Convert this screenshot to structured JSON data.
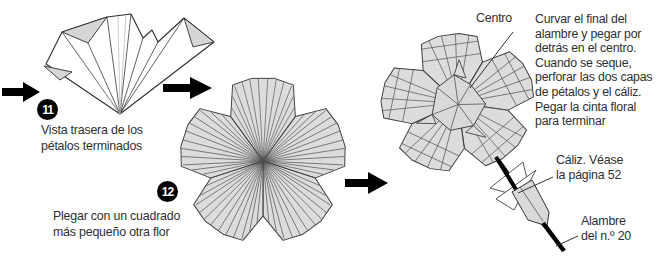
{
  "figure": {
    "steps": [
      {
        "number": "11",
        "caption": "Vista trasera de los\npétalos terminados"
      },
      {
        "number": "12",
        "caption": "Plegar con un cuadrado\nmás pequeño otra flor"
      }
    ],
    "labels": {
      "centro": "Centro",
      "caliz": "Cáliz. Véase\nla página 52",
      "alambre": "Alambre\ndel n.º 20"
    },
    "note": "Curvar el final del\nalambre y pegar por\ndetrás en el centro.\nCuando se seque,\nperforar las dos capas\nde pétalos y el cáliz.\nPegar la cinta floral\npara terminar",
    "colors": {
      "paper": "#dcdcdc",
      "outline": "#2e2e2e",
      "text": "#2f2f2f",
      "accent_black": "#000000"
    }
  }
}
